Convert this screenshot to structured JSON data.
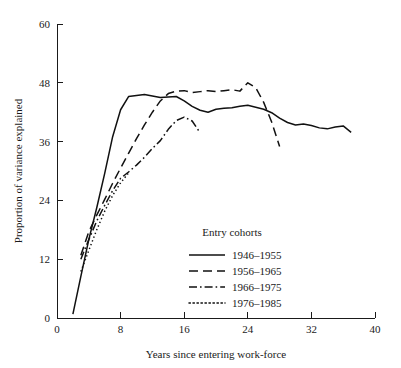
{
  "chart_data": {
    "type": "line",
    "title": "",
    "xlabel": "Years since entering work-force",
    "ylabel": "Proportion of variance explained",
    "xlim": [
      0,
      40
    ],
    "ylim": [
      0,
      60
    ],
    "xticks": [
      "0",
      "8",
      "16",
      "24",
      "32",
      "40"
    ],
    "xtick_values": [
      0,
      8,
      16,
      24,
      32,
      40
    ],
    "yticks": [
      "0",
      "12",
      "24",
      "36",
      "48",
      "60"
    ],
    "ytick_values": [
      0,
      12,
      24,
      36,
      48,
      60
    ],
    "grid": false,
    "legend_position": "inside-lower-center",
    "legend_title": "Entry cohorts",
    "series": [
      {
        "name": "1946–1955",
        "style": "solid",
        "x": [
          2.0,
          3.0,
          4.0,
          5.0,
          6.0,
          7.0,
          8.0,
          9.0,
          10.0,
          11.0,
          12.0,
          13.0,
          14.0,
          15.0,
          16.0,
          17.0,
          18.0,
          19.0,
          20.0,
          21.0,
          22.0,
          23.0,
          24.0,
          25.0,
          26.0,
          27.0,
          28.0,
          29.0,
          30.0,
          31.0,
          32.0,
          33.0,
          34.0,
          35.0,
          36.0,
          37.0
        ],
        "y": [
          0.8,
          8.5,
          16.0,
          22.5,
          29.5,
          37.0,
          42.5,
          45.2,
          45.4,
          45.6,
          45.3,
          45.0,
          45.1,
          45.2,
          44.3,
          43.2,
          42.4,
          42.0,
          42.6,
          42.8,
          42.9,
          43.2,
          43.4,
          43.0,
          42.6,
          41.9,
          40.8,
          39.9,
          39.4,
          39.6,
          39.3,
          38.8,
          38.6,
          39.0,
          39.2,
          37.9
        ]
      },
      {
        "name": "1956–1965",
        "style": "dashed",
        "x": [
          3.0,
          4.0,
          5.0,
          6.0,
          7.0,
          8.0,
          9.0,
          10.0,
          11.0,
          12.0,
          13.0,
          14.0,
          15.0,
          16.0,
          17.0,
          18.0,
          19.0,
          20.0,
          21.0,
          22.0,
          23.0,
          24.0,
          25.0,
          26.0,
          27.0,
          28.0
        ],
        "y": [
          12.8,
          17.6,
          21.0,
          24.2,
          27.5,
          30.6,
          33.6,
          36.6,
          39.4,
          42.0,
          44.3,
          45.8,
          46.3,
          46.4,
          46.0,
          46.2,
          46.4,
          46.2,
          46.4,
          46.6,
          46.3,
          48.0,
          47.0,
          44.0,
          40.0,
          35.0
        ]
      },
      {
        "name": "1966–1975",
        "style": "dashdot",
        "x": [
          3.0,
          4.0,
          5.0,
          6.0,
          7.0,
          8.0,
          9.0,
          10.0,
          11.0,
          12.0,
          13.0,
          14.0,
          15.0,
          16.0,
          17.0,
          18.0
        ],
        "y": [
          12.0,
          16.0,
          19.8,
          23.0,
          26.0,
          28.5,
          29.8,
          31.2,
          32.8,
          34.6,
          36.2,
          38.5,
          40.3,
          41.0,
          40.2,
          37.8
        ]
      },
      {
        "name": "1976–1985",
        "style": "dotted",
        "x": [
          3.0,
          4.0,
          5.0,
          6.0,
          7.0,
          8.0,
          9.0
        ],
        "y": [
          9.5,
          13.8,
          18.0,
          21.8,
          25.0,
          27.6,
          29.6
        ]
      }
    ]
  },
  "legend": {
    "title": "Entry cohorts",
    "items": [
      {
        "label": "1946–1955",
        "style": "solid"
      },
      {
        "label": "1956–1965",
        "style": "dashed"
      },
      {
        "label": "1966–1975",
        "style": "dashdot"
      },
      {
        "label": "1976–1985",
        "style": "dotted"
      }
    ]
  }
}
